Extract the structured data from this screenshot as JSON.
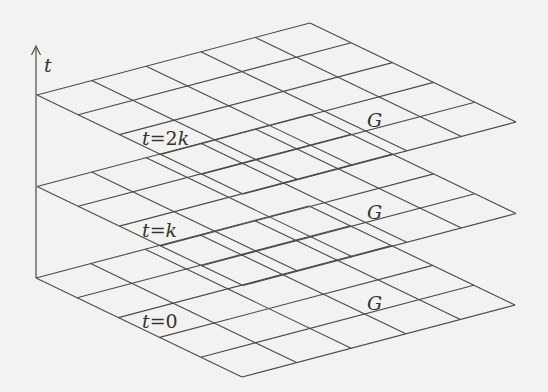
{
  "diagram": {
    "axis": {
      "label": "t",
      "direction": "up"
    },
    "grid": {
      "rows": 5,
      "cols": 5,
      "label": "G"
    },
    "layers": [
      {
        "name": "top",
        "t_var": "t",
        "t_val": "2k",
        "grid_label": "G",
        "offset_y": 0
      },
      {
        "name": "middle",
        "t_var": "t",
        "t_val": "k",
        "grid_label": "G",
        "offset_y": 91.5
      },
      {
        "name": "bottom",
        "t_var": "t",
        "t_val": "0",
        "grid_label": "G",
        "offset_y": 183
      }
    ],
    "colors": {
      "line": "#4a4a4a",
      "background": "#f2f2f0",
      "text": "#333333"
    }
  }
}
